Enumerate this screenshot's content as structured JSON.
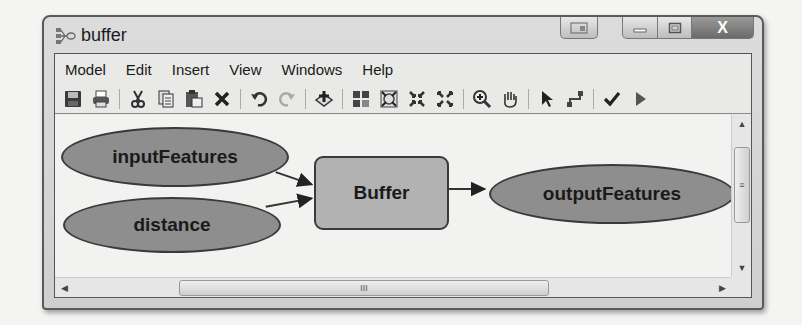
{
  "window": {
    "title": "buffer",
    "icon": "model-builder-icon",
    "caption_buttons": [
      "extra-icon",
      "minimize-icon",
      "maximize-icon",
      "close-icon"
    ],
    "close_glyph": "X"
  },
  "menubar": {
    "items": [
      {
        "label": "Model"
      },
      {
        "label": "Edit"
      },
      {
        "label": "Insert"
      },
      {
        "label": "View"
      },
      {
        "label": "Windows"
      },
      {
        "label": "Help"
      }
    ]
  },
  "toolbar": {
    "groups": [
      [
        "save-icon",
        "print-icon"
      ],
      [
        "cut-icon",
        "copy-icon",
        "paste-icon",
        "delete-icon"
      ],
      [
        "undo-icon",
        "redo-icon"
      ],
      [
        "add-data-icon"
      ],
      [
        "auto-layout-icon",
        "full-extent-icon",
        "zoom-in-fixed-icon",
        "zoom-out-fixed-icon"
      ],
      [
        "zoom-in-icon",
        "pan-icon"
      ],
      [
        "select-icon",
        "connect-icon"
      ],
      [
        "validate-icon",
        "run-icon"
      ]
    ]
  },
  "diagram": {
    "nodes": [
      {
        "id": "inputFeatures",
        "label": "inputFeatures",
        "shape": "ellipse",
        "color": "#8e8e8e"
      },
      {
        "id": "distance",
        "label": "distance",
        "shape": "ellipse",
        "color": "#8e8e8e"
      },
      {
        "id": "buffer",
        "label": "Buffer",
        "shape": "rounded-rect",
        "color": "#b2b2b2"
      },
      {
        "id": "outputFeatures",
        "label": "outputFeatures",
        "shape": "ellipse",
        "color": "#8e8e8e"
      }
    ],
    "edges": [
      {
        "from": "inputFeatures",
        "to": "buffer"
      },
      {
        "from": "distance",
        "to": "buffer"
      },
      {
        "from": "buffer",
        "to": "outputFeatures"
      }
    ]
  },
  "scrollbars": {
    "vertical_grip": "≡",
    "horizontal_grip": "III"
  }
}
